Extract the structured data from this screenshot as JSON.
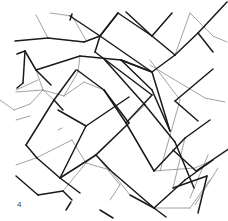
{
  "figure": {
    "panel_label": "4",
    "colors": {
      "background": "#ffffff",
      "heavy_line": "#1a1a1a",
      "light_line": "#8a8a8a",
      "label": "#444444"
    },
    "heavy_lines": [
      [
        15,
        41,
        48,
        38
      ],
      [
        48,
        38,
        84,
        42
      ],
      [
        84,
        42,
        100,
        36
      ],
      [
        100,
        36,
        118,
        13
      ],
      [
        70,
        16,
        100,
        36
      ],
      [
        100,
        36,
        152,
        72
      ],
      [
        72,
        14,
        70,
        20
      ],
      [
        17,
        54,
        25,
        51
      ],
      [
        25,
        51,
        36,
        70
      ],
      [
        36,
        70,
        80,
        56
      ],
      [
        80,
        56,
        121,
        60
      ],
      [
        121,
        60,
        152,
        72
      ],
      [
        25,
        51,
        23,
        83
      ],
      [
        23,
        83,
        17,
        88
      ],
      [
        36,
        70,
        51,
        85
      ],
      [
        121,
        60,
        152,
        72
      ],
      [
        95,
        52,
        152,
        95
      ],
      [
        95,
        52,
        100,
        36
      ],
      [
        118,
        13,
        152,
        36
      ],
      [
        152,
        36,
        175,
        55
      ],
      [
        175,
        55,
        198,
        33
      ],
      [
        198,
        33,
        213,
        52
      ],
      [
        126,
        12,
        152,
        36
      ],
      [
        152,
        36,
        172,
        13
      ],
      [
        100,
        36,
        118,
        13
      ],
      [
        104,
        59,
        145,
        105
      ],
      [
        145,
        105,
        175,
        142
      ],
      [
        175,
        142,
        194,
        188
      ],
      [
        121,
        60,
        152,
        90
      ],
      [
        152,
        90,
        170,
        131
      ],
      [
        152,
        72,
        170,
        131
      ],
      [
        175,
        55,
        152,
        72
      ],
      [
        198,
        33,
        227,
        2
      ],
      [
        175,
        101,
        213,
        69
      ],
      [
        175,
        101,
        198,
        121
      ],
      [
        77,
        70,
        104,
        90
      ],
      [
        104,
        90,
        129,
        123
      ],
      [
        76,
        70,
        54,
        100
      ],
      [
        54,
        100,
        63,
        110
      ],
      [
        54,
        100,
        26,
        145
      ],
      [
        104,
        90,
        126,
        123
      ],
      [
        26,
        145,
        37,
        158
      ],
      [
        37,
        158,
        60,
        178
      ],
      [
        60,
        178,
        96,
        155
      ],
      [
        96,
        155,
        110,
        170
      ],
      [
        60,
        178,
        80,
        193
      ],
      [
        110,
        170,
        154,
        208
      ],
      [
        154,
        208,
        185,
        180
      ],
      [
        185,
        180,
        213,
        160
      ],
      [
        126,
        123,
        154,
        171
      ],
      [
        154,
        171,
        185,
        138
      ],
      [
        185,
        138,
        210,
        120
      ],
      [
        152,
        95,
        126,
        123
      ],
      [
        58,
        110,
        86,
        126
      ],
      [
        86,
        126,
        60,
        178
      ],
      [
        86,
        126,
        129,
        97
      ],
      [
        129,
        123,
        96,
        155
      ],
      [
        196,
        171,
        230,
        148
      ],
      [
        196,
        171,
        173,
        150
      ],
      [
        16,
        176,
        38,
        195
      ],
      [
        38,
        195,
        63,
        191
      ],
      [
        63,
        191,
        72,
        200
      ],
      [
        173,
        188,
        207,
        176
      ],
      [
        207,
        176,
        198,
        213
      ],
      [
        130,
        195,
        154,
        208
      ],
      [
        154,
        208,
        166,
        217
      ],
      [
        100,
        210,
        113,
        218
      ],
      [
        66,
        210,
        71,
        202
      ]
    ],
    "light_lines": [
      [
        36,
        15,
        48,
        38
      ],
      [
        50,
        13,
        72,
        16
      ],
      [
        72,
        16,
        86,
        40
      ],
      [
        0,
        100,
        14,
        110
      ],
      [
        14,
        110,
        30,
        104
      ],
      [
        30,
        104,
        43,
        90
      ],
      [
        43,
        90,
        54,
        100
      ],
      [
        16,
        92,
        43,
        90
      ],
      [
        16,
        90,
        38,
        80
      ],
      [
        36,
        70,
        43,
        90
      ],
      [
        43,
        90,
        64,
        96
      ],
      [
        80,
        56,
        78,
        72
      ],
      [
        78,
        72,
        64,
        96
      ],
      [
        64,
        96,
        84,
        82
      ],
      [
        84,
        82,
        104,
        90
      ],
      [
        152,
        36,
        172,
        13
      ],
      [
        190,
        13,
        213,
        36
      ],
      [
        213,
        36,
        227,
        42
      ],
      [
        175,
        55,
        190,
        13
      ],
      [
        150,
        65,
        205,
        98
      ],
      [
        205,
        98,
        225,
        102
      ],
      [
        150,
        60,
        180,
        100
      ],
      [
        126,
        123,
        145,
        105
      ],
      [
        154,
        171,
        195,
        168
      ],
      [
        195,
        168,
        213,
        160
      ],
      [
        160,
        171,
        180,
        100
      ],
      [
        129,
        123,
        86,
        163
      ],
      [
        86,
        163,
        110,
        170
      ],
      [
        36,
        158,
        72,
        140
      ],
      [
        72,
        140,
        86,
        163
      ],
      [
        16,
        165,
        36,
        158
      ],
      [
        16,
        120,
        30,
        116
      ],
      [
        110,
        170,
        130,
        195
      ],
      [
        185,
        138,
        173,
        188
      ],
      [
        208,
        155,
        190,
        198
      ],
      [
        63,
        191,
        86,
        163
      ],
      [
        154,
        208,
        190,
        208
      ],
      [
        190,
        208,
        210,
        180
      ],
      [
        195,
        205,
        218,
        168
      ],
      [
        96,
        155,
        120,
        185
      ],
      [
        120,
        185,
        110,
        200
      ],
      [
        58,
        130,
        62,
        128
      ]
    ]
  }
}
